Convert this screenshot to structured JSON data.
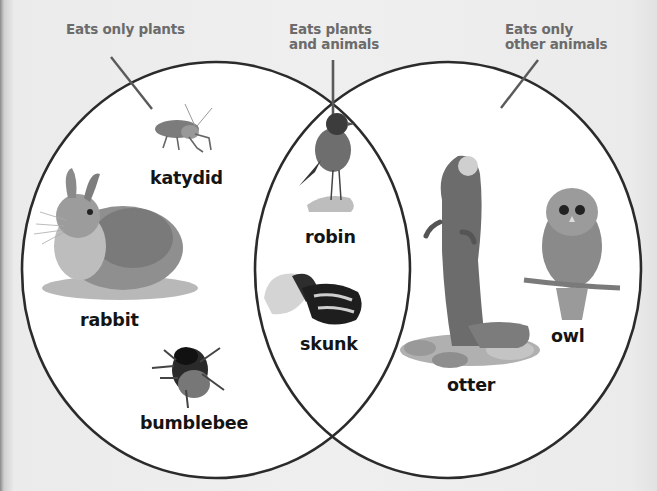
{
  "diagram": {
    "type": "venn",
    "sets": [
      {
        "id": "herbivores",
        "label_line1": "Eats only plants",
        "label_line2": ""
      },
      {
        "id": "omnivores",
        "label_line1": "Eats plants",
        "label_line2": "and animals"
      },
      {
        "id": "carnivores",
        "label_line1": "Eats only",
        "label_line2": "other animals"
      }
    ],
    "regions": {
      "plants_only": [
        "katydid",
        "rabbit",
        "bumblebee"
      ],
      "plants_and_animals": [
        "robin",
        "skunk"
      ],
      "animals_only": [
        "otter",
        "owl"
      ]
    },
    "animals": {
      "katydid": "katydid",
      "rabbit": "rabbit",
      "bumblebee": "bumblebee",
      "robin": "robin",
      "skunk": "skunk",
      "otter": "otter",
      "owl": "owl"
    },
    "colors": {
      "background": "#ececec",
      "circle_fill": "#ffffff",
      "circle_stroke": "#2b2b2b",
      "leader_line": "#555555",
      "category_text": "#6b6b6b",
      "animal_text": "#141414"
    }
  }
}
